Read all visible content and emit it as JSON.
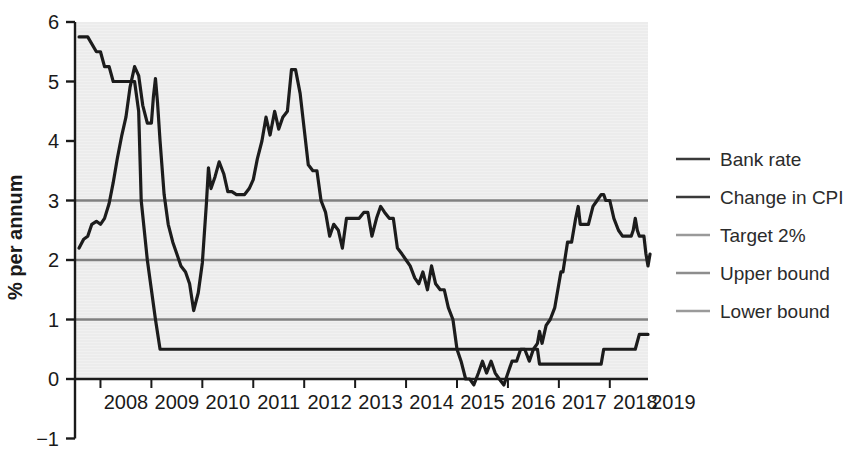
{
  "chart_data": {
    "type": "line",
    "title": "",
    "xlabel": "",
    "ylabel": "% per annum",
    "xlim": [
      2007.5,
      2018.75
    ],
    "ylim": [
      -1,
      6
    ],
    "yticks": [
      -1,
      0,
      1,
      2,
      3,
      4,
      5,
      6
    ],
    "ytick_labels": [
      "−1",
      "0",
      "1",
      "2",
      "3",
      "4",
      "5",
      "6"
    ],
    "xticks": [
      2008,
      2009,
      2010,
      2011,
      2012,
      2013,
      2014,
      2015,
      2016,
      2017,
      2018,
      2019
    ],
    "xtick_labels": [
      "2008",
      "2009",
      "2010",
      "2011",
      "2012",
      "2013",
      "2014",
      "2015",
      "2016",
      "2017",
      "2018",
      "2019"
    ],
    "grid": false,
    "legend_position": "right",
    "plot_background": "#ececec",
    "series": [
      {
        "name": "Bank rate",
        "color": "#1c1c1c",
        "width": 3.2,
        "points": [
          [
            2007.58,
            5.75
          ],
          [
            2007.75,
            5.75
          ],
          [
            2007.92,
            5.5
          ],
          [
            2008.0,
            5.5
          ],
          [
            2008.08,
            5.25
          ],
          [
            2008.17,
            5.25
          ],
          [
            2008.25,
            5.0
          ],
          [
            2008.33,
            5.0
          ],
          [
            2008.5,
            5.0
          ],
          [
            2008.67,
            5.0
          ],
          [
            2008.75,
            4.5
          ],
          [
            2008.8,
            3.0
          ],
          [
            2008.92,
            2.0
          ],
          [
            2009.0,
            1.5
          ],
          [
            2009.08,
            1.0
          ],
          [
            2009.17,
            0.5
          ],
          [
            2009.25,
            0.5
          ],
          [
            2010.0,
            0.5
          ],
          [
            2011.0,
            0.5
          ],
          [
            2012.0,
            0.5
          ],
          [
            2013.0,
            0.5
          ],
          [
            2014.0,
            0.5
          ],
          [
            2015.0,
            0.5
          ],
          [
            2016.0,
            0.5
          ],
          [
            2016.58,
            0.5
          ],
          [
            2016.62,
            0.25
          ],
          [
            2017.0,
            0.25
          ],
          [
            2017.5,
            0.25
          ],
          [
            2017.83,
            0.25
          ],
          [
            2017.88,
            0.5
          ],
          [
            2018.0,
            0.5
          ],
          [
            2018.5,
            0.5
          ],
          [
            2018.58,
            0.75
          ],
          [
            2018.75,
            0.75
          ]
        ]
      },
      {
        "name": "Change in CPI",
        "color": "#1c1c1c",
        "width": 3.2,
        "points": [
          [
            2007.58,
            2.2
          ],
          [
            2007.67,
            2.35
          ],
          [
            2007.75,
            2.4
          ],
          [
            2007.83,
            2.6
          ],
          [
            2007.92,
            2.65
          ],
          [
            2008.0,
            2.6
          ],
          [
            2008.08,
            2.7
          ],
          [
            2008.17,
            2.95
          ],
          [
            2008.25,
            3.3
          ],
          [
            2008.33,
            3.7
          ],
          [
            2008.42,
            4.1
          ],
          [
            2008.5,
            4.4
          ],
          [
            2008.58,
            4.9
          ],
          [
            2008.67,
            5.25
          ],
          [
            2008.75,
            5.1
          ],
          [
            2008.83,
            4.6
          ],
          [
            2008.92,
            4.3
          ],
          [
            2009.0,
            4.3
          ],
          [
            2009.04,
            4.75
          ],
          [
            2009.08,
            5.05
          ],
          [
            2009.12,
            4.65
          ],
          [
            2009.17,
            4.0
          ],
          [
            2009.25,
            3.1
          ],
          [
            2009.33,
            2.6
          ],
          [
            2009.42,
            2.3
          ],
          [
            2009.5,
            2.1
          ],
          [
            2009.58,
            1.9
          ],
          [
            2009.67,
            1.8
          ],
          [
            2009.75,
            1.6
          ],
          [
            2009.83,
            1.15
          ],
          [
            2009.92,
            1.45
          ],
          [
            2010.0,
            1.95
          ],
          [
            2010.08,
            2.95
          ],
          [
            2010.12,
            3.55
          ],
          [
            2010.17,
            3.2
          ],
          [
            2010.25,
            3.4
          ],
          [
            2010.33,
            3.65
          ],
          [
            2010.42,
            3.45
          ],
          [
            2010.5,
            3.15
          ],
          [
            2010.58,
            3.15
          ],
          [
            2010.67,
            3.1
          ],
          [
            2010.75,
            3.1
          ],
          [
            2010.83,
            3.1
          ],
          [
            2010.92,
            3.2
          ],
          [
            2011.0,
            3.35
          ],
          [
            2011.08,
            3.7
          ],
          [
            2011.17,
            4.0
          ],
          [
            2011.25,
            4.4
          ],
          [
            2011.33,
            4.1
          ],
          [
            2011.42,
            4.5
          ],
          [
            2011.5,
            4.2
          ],
          [
            2011.58,
            4.4
          ],
          [
            2011.67,
            4.5
          ],
          [
            2011.75,
            5.2
          ],
          [
            2011.83,
            5.2
          ],
          [
            2011.92,
            4.8
          ],
          [
            2012.0,
            4.2
          ],
          [
            2012.08,
            3.6
          ],
          [
            2012.17,
            3.5
          ],
          [
            2012.25,
            3.5
          ],
          [
            2012.33,
            3.0
          ],
          [
            2012.42,
            2.8
          ],
          [
            2012.5,
            2.4
          ],
          [
            2012.58,
            2.6
          ],
          [
            2012.67,
            2.5
          ],
          [
            2012.75,
            2.2
          ],
          [
            2012.83,
            2.7
          ],
          [
            2012.92,
            2.7
          ],
          [
            2013.0,
            2.7
          ],
          [
            2013.08,
            2.7
          ],
          [
            2013.17,
            2.8
          ],
          [
            2013.25,
            2.8
          ],
          [
            2013.33,
            2.4
          ],
          [
            2013.42,
            2.7
          ],
          [
            2013.5,
            2.9
          ],
          [
            2013.58,
            2.8
          ],
          [
            2013.67,
            2.7
          ],
          [
            2013.75,
            2.7
          ],
          [
            2013.83,
            2.2
          ],
          [
            2013.92,
            2.1
          ],
          [
            2014.0,
            2.0
          ],
          [
            2014.08,
            1.9
          ],
          [
            2014.17,
            1.7
          ],
          [
            2014.25,
            1.6
          ],
          [
            2014.33,
            1.8
          ],
          [
            2014.42,
            1.5
          ],
          [
            2014.5,
            1.9
          ],
          [
            2014.58,
            1.6
          ],
          [
            2014.67,
            1.5
          ],
          [
            2014.75,
            1.5
          ],
          [
            2014.83,
            1.2
          ],
          [
            2014.92,
            1.0
          ],
          [
            2015.0,
            0.5
          ],
          [
            2015.08,
            0.3
          ],
          [
            2015.17,
            0.0
          ],
          [
            2015.25,
            0.0
          ],
          [
            2015.33,
            -0.1
          ],
          [
            2015.42,
            0.1
          ],
          [
            2015.5,
            0.3
          ],
          [
            2015.58,
            0.1
          ],
          [
            2015.67,
            0.3
          ],
          [
            2015.75,
            0.1
          ],
          [
            2015.83,
            0.0
          ],
          [
            2015.92,
            -0.1
          ],
          [
            2016.0,
            0.1
          ],
          [
            2016.08,
            0.3
          ],
          [
            2016.17,
            0.3
          ],
          [
            2016.25,
            0.5
          ],
          [
            2016.33,
            0.5
          ],
          [
            2016.42,
            0.3
          ],
          [
            2016.5,
            0.5
          ],
          [
            2016.58,
            0.6
          ],
          [
            2016.62,
            0.8
          ],
          [
            2016.67,
            0.6
          ],
          [
            2016.75,
            0.9
          ],
          [
            2016.83,
            1.0
          ],
          [
            2016.92,
            1.2
          ],
          [
            2017.0,
            1.6
          ],
          [
            2017.04,
            1.8
          ],
          [
            2017.08,
            1.8
          ],
          [
            2017.17,
            2.3
          ],
          [
            2017.25,
            2.3
          ],
          [
            2017.33,
            2.7
          ],
          [
            2017.38,
            2.9
          ],
          [
            2017.42,
            2.6
          ],
          [
            2017.5,
            2.6
          ],
          [
            2017.58,
            2.6
          ],
          [
            2017.67,
            2.9
          ],
          [
            2017.75,
            3.0
          ],
          [
            2017.83,
            3.1
          ],
          [
            2017.88,
            3.1
          ],
          [
            2017.92,
            3.0
          ],
          [
            2018.0,
            3.0
          ],
          [
            2018.08,
            2.7
          ],
          [
            2018.17,
            2.5
          ],
          [
            2018.25,
            2.4
          ],
          [
            2018.33,
            2.4
          ],
          [
            2018.42,
            2.4
          ],
          [
            2018.46,
            2.5
          ],
          [
            2018.5,
            2.7
          ],
          [
            2018.54,
            2.5
          ],
          [
            2018.58,
            2.4
          ],
          [
            2018.62,
            2.4
          ],
          [
            2018.67,
            2.4
          ],
          [
            2018.71,
            2.1
          ],
          [
            2018.75,
            1.9
          ],
          [
            2018.79,
            2.1
          ]
        ]
      },
      {
        "name": "Target 2%",
        "color": "#808080",
        "width": 2.4,
        "constant": 2
      },
      {
        "name": "Upper bound",
        "color": "#808080",
        "width": 2.4,
        "constant": 3
      },
      {
        "name": "Lower bound",
        "color": "#808080",
        "width": 2.4,
        "constant": 1
      }
    ],
    "legend": [
      {
        "label": "Bank rate",
        "color": "#3a3a3a"
      },
      {
        "label": "Change in CPI",
        "color": "#3a3a3a"
      },
      {
        "label": "Target 2%",
        "color": "#9a9a9a"
      },
      {
        "label": "Upper bound",
        "color": "#8d8d8d"
      },
      {
        "label": "Lower bound",
        "color": "#9a9a9a"
      }
    ]
  }
}
